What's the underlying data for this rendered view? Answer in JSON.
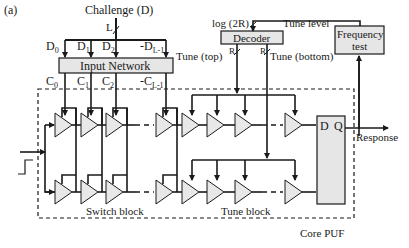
{
  "figure": {
    "panel_label": "(a)",
    "challenge_label": "Challenge (D)",
    "bus_width_label": "L",
    "inputs_top": [
      "D0",
      "D1",
      "D2",
      "D(L-1)"
    ],
    "input_labels": {
      "d0": "D",
      "d0_sub": "0",
      "d1": "D",
      "d1_sub": "1",
      "d2": "D",
      "d2_sub": "2",
      "dl": "-D",
      "dl_sub": "L-1"
    },
    "input_network_label": "Input Network",
    "output_labels": {
      "c0": "C",
      "c0_sub": "0",
      "c1": "C",
      "c1_sub": "1",
      "c2": "C",
      "c2_sub": "2",
      "cl": "-C",
      "cl_sub": "L-1"
    },
    "log_label": "log (2R)",
    "decoder_label": "Decoder",
    "tune_level_label": "Tune level",
    "frequency_test_label_1": "Frequency",
    "frequency_test_label_2": "test",
    "tune_top_label": "Tune (top)",
    "tune_bottom_label": "Tune (bottom)",
    "r_label_1": "R",
    "r_label_2": "R",
    "flipflop_d": "D",
    "flipflop_q": "Q",
    "response_label": "Response",
    "switch_block_label": "Switch block",
    "tune_block_label": "Tune block",
    "core_puf_label": "Core PUF",
    "colors": {
      "stroke": "#1a1a1a",
      "fill_box": "#e6e6e6",
      "fill_buffer": "#e8e8e8"
    }
  }
}
